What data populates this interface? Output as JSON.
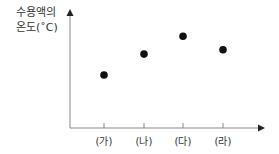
{
  "chart_data": {
    "type": "scatter",
    "title": "",
    "xlabel": "",
    "ylabel": "수용액의 온도(˚C)",
    "ylabel_lines": [
      "수용액의",
      "온도(˚C)"
    ],
    "categories": [
      "(가)",
      "(나)",
      "(다)",
      "(라)"
    ],
    "values": [
      1,
      2.4,
      3.6,
      2.7
    ],
    "y_ticks": "none",
    "grid": false,
    "legend": "none",
    "note": "Relative values only; y-axis has no numeric scale. Order: 다 > 라 > 나 > 가"
  }
}
